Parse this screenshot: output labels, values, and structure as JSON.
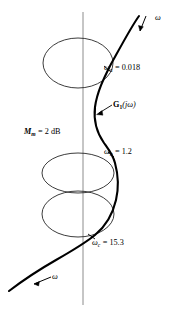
{
  "figure": {
    "type": "polar-frequency-response-diagram",
    "colors": {
      "curve": "#000000",
      "circles": "#1a1a1a",
      "axis": "#808080",
      "background": "#ffffff",
      "text": "#000000"
    },
    "axis": {
      "orientation": "vertical",
      "x": 83,
      "y_top": 12,
      "y_bottom": 305,
      "color": "#808080"
    },
    "m_circles": [
      {
        "name": "m-circle-top",
        "cx": 78,
        "cy": 63,
        "rx": 35,
        "ry": 25
      },
      {
        "name": "m-circle-middle",
        "cx": 78,
        "cy": 173,
        "rx": 36,
        "ry": 20
      },
      {
        "name": "m-circle-bottom",
        "cx": 78,
        "cy": 214,
        "rx": 36,
        "ry": 23
      }
    ],
    "labels": {
      "omega_a": {
        "symbol": "ω",
        "subscript": "a",
        "equals": "=",
        "value": "0.018",
        "full": "ωa = 0.018"
      },
      "omega_b": {
        "symbol": "ω",
        "subscript": "b",
        "equals": "=",
        "value": "1.2",
        "full": "ωb = 1.2"
      },
      "omega_c": {
        "symbol": "ω",
        "subscript": "c",
        "equals": "=",
        "value": "15.3",
        "full": "ωc = 15.3"
      },
      "m_m": {
        "symbol": "M",
        "subscript": "m",
        "equals": "=",
        "value": "2",
        "unit": "dB",
        "full": "Mm = 2 dB"
      },
      "transfer_function": {
        "symbol": "G",
        "subscript": "1",
        "argument": "(jω)",
        "full": "G1(jω)"
      },
      "omega_arrow_top": "ω",
      "omega_arrow_bottom": "ω"
    },
    "markers": [
      {
        "name": "omega-a-point",
        "x": 108,
        "y": 70
      },
      {
        "name": "omega-b-point",
        "x": 112,
        "y": 155
      },
      {
        "name": "omega-c-point",
        "x": 92,
        "y": 237
      }
    ]
  }
}
